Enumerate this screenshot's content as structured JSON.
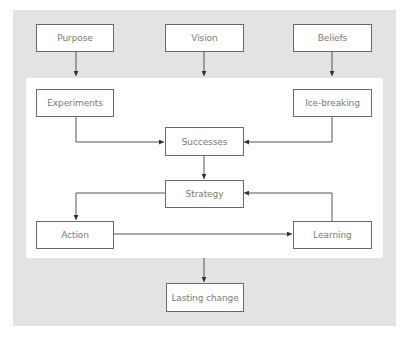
{
  "diagram": {
    "colors": {
      "background_band": "#e3e3e3",
      "inner_panel": "#ffffff",
      "box_border": "#6a6a6a",
      "box_text": "#7a7a7a",
      "connector": "#555555"
    },
    "top_row": {
      "purpose": "Purpose",
      "vision": "Vision",
      "beliefs": "Beliefs"
    },
    "inner": {
      "experiments": "Experiments",
      "ice_breaking": "Ice-breaking",
      "successes": "Successes",
      "strategy": "Strategy",
      "action": "Action",
      "learning": "Learning"
    },
    "outcome": {
      "lasting_change": "Lasting change"
    },
    "edges": [
      {
        "from": "Purpose",
        "to": "inner panel"
      },
      {
        "from": "Vision",
        "to": "inner panel"
      },
      {
        "from": "Beliefs",
        "to": "inner panel"
      },
      {
        "from": "Experiments",
        "to": "Successes"
      },
      {
        "from": "Ice-breaking",
        "to": "Successes"
      },
      {
        "from": "Successes",
        "to": "Strategy"
      },
      {
        "from": "Strategy",
        "to": "Action"
      },
      {
        "from": "Action",
        "to": "Learning"
      },
      {
        "from": "Learning",
        "to": "Strategy"
      },
      {
        "from": "inner panel",
        "to": "Lasting change"
      }
    ]
  }
}
